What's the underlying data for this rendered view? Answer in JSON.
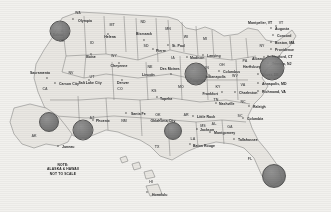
{
  "map": {
    "title": "United States state capitals map with highlighted metro markers",
    "note_lines": [
      "NOTE:",
      "ALASKA & HAWAII",
      "NOT TO SCALE"
    ],
    "colors": {
      "land": "#e9e7e2",
      "border": "#6f6f6f",
      "water": "#f2f1ee",
      "marker": "#747474",
      "text": "#1b1b1b"
    },
    "state_abbrs": [
      {
        "text": "WA",
        "x": 78,
        "y": 14
      },
      {
        "text": "OR",
        "x": 62,
        "y": 42
      },
      {
        "text": "CA",
        "x": 45,
        "y": 90
      },
      {
        "text": "ID",
        "x": 92,
        "y": 44
      },
      {
        "text": "NV",
        "x": 71,
        "y": 74
      },
      {
        "text": "UT",
        "x": 92,
        "y": 78
      },
      {
        "text": "AZ",
        "x": 92,
        "y": 119
      },
      {
        "text": "MT",
        "x": 112,
        "y": 26
      },
      {
        "text": "WY",
        "x": 114,
        "y": 57
      },
      {
        "text": "CO",
        "x": 120,
        "y": 90
      },
      {
        "text": "NM",
        "x": 124,
        "y": 122
      },
      {
        "text": "ND",
        "x": 143,
        "y": 23
      },
      {
        "text": "SD",
        "x": 146,
        "y": 47
      },
      {
        "text": "NE",
        "x": 150,
        "y": 68
      },
      {
        "text": "KS",
        "x": 154,
        "y": 92
      },
      {
        "text": "OK",
        "x": 158,
        "y": 116
      },
      {
        "text": "TX",
        "x": 157,
        "y": 148
      },
      {
        "text": "MN",
        "x": 168,
        "y": 30
      },
      {
        "text": "IA",
        "x": 173,
        "y": 59
      },
      {
        "text": "MO",
        "x": 181,
        "y": 88
      },
      {
        "text": "AR",
        "x": 186,
        "y": 116
      },
      {
        "text": "LA",
        "x": 193,
        "y": 140
      },
      {
        "text": "WI",
        "x": 186,
        "y": 38
      },
      {
        "text": "IL",
        "x": 193,
        "y": 70
      },
      {
        "text": "MI",
        "x": 205,
        "y": 40
      },
      {
        "text": "IN",
        "x": 207,
        "y": 69
      },
      {
        "text": "OH",
        "x": 222,
        "y": 66
      },
      {
        "text": "KY",
        "x": 218,
        "y": 88
      },
      {
        "text": "TN",
        "x": 216,
        "y": 101
      },
      {
        "text": "MS",
        "x": 203,
        "y": 127
      },
      {
        "text": "AL",
        "x": 214,
        "y": 125
      },
      {
        "text": "GA",
        "x": 230,
        "y": 128
      },
      {
        "text": "FL",
        "x": 250,
        "y": 160
      },
      {
        "text": "SC",
        "x": 240,
        "y": 117
      },
      {
        "text": "NC",
        "x": 243,
        "y": 103
      },
      {
        "text": "VA",
        "x": 243,
        "y": 86
      },
      {
        "text": "WV",
        "x": 235,
        "y": 77
      },
      {
        "text": "PA",
        "x": 245,
        "y": 62
      },
      {
        "text": "NY",
        "x": 262,
        "y": 47
      },
      {
        "text": "VT",
        "x": 281,
        "y": 24
      },
      {
        "text": "AK",
        "x": 34,
        "y": 137
      },
      {
        "text": "HI",
        "x": 151,
        "y": 183
      }
    ],
    "capitals": [
      {
        "name": "Salem",
        "x": 58,
        "y": 36,
        "sx": 62,
        "sy": 31,
        "align": "center"
      },
      {
        "name": "Olympia",
        "x": 78,
        "y": 22,
        "sx": 73,
        "sy": 19,
        "align": "left"
      },
      {
        "name": "Boise",
        "x": 91,
        "y": 58,
        "sx": 91,
        "sy": 54,
        "align": "center"
      },
      {
        "name": "Helena",
        "x": 110,
        "y": 38,
        "sx": 108,
        "sy": 34,
        "align": "center"
      },
      {
        "name": "Sacramento",
        "x": 30,
        "y": 74,
        "sx": 47,
        "sy": 78,
        "align": "left"
      },
      {
        "name": "Carson City",
        "x": 59,
        "y": 85,
        "sx": 55,
        "sy": 83,
        "align": "left"
      },
      {
        "name": "Salt Lake City",
        "x": 90,
        "y": 84,
        "sx": 89,
        "sy": 80,
        "align": "center"
      },
      {
        "name": "Cheyenne",
        "x": 119,
        "y": 67,
        "sx": 119,
        "sy": 63,
        "align": "center"
      },
      {
        "name": "Denver",
        "x": 123,
        "y": 84,
        "sx": 122,
        "sy": 80,
        "align": "center"
      },
      {
        "name": "Santa Fe",
        "x": 131,
        "y": 115,
        "sx": 126,
        "sy": 113,
        "align": "left"
      },
      {
        "name": "Bismarck",
        "x": 144,
        "y": 35,
        "sx": 144,
        "sy": 40,
        "align": "center"
      },
      {
        "name": "Pierre",
        "x": 156,
        "y": 52,
        "sx": 153,
        "sy": 49,
        "align": "left"
      },
      {
        "name": "St. Paul",
        "x": 172,
        "y": 47,
        "sx": 168,
        "sy": 45,
        "align": "left"
      },
      {
        "name": "Des Moines",
        "x": 170,
        "y": 70,
        "sx": 171,
        "sy": 74,
        "align": "center"
      },
      {
        "name": "Lincoln",
        "x": 142,
        "y": 76,
        "sx": 152,
        "sy": 75,
        "align": "left"
      },
      {
        "name": "Topeka",
        "x": 160,
        "y": 100,
        "sx": 157,
        "sy": 97,
        "align": "left"
      },
      {
        "name": "Oklahoma City",
        "x": 163,
        "y": 122,
        "sx": 161,
        "sy": 119,
        "align": "center"
      },
      {
        "name": "Little Rock",
        "x": 197,
        "y": 118,
        "sx": 193,
        "sy": 116,
        "align": "left"
      },
      {
        "name": "Jackson",
        "x": 200,
        "y": 131,
        "sx": 197,
        "sy": 129,
        "align": "left"
      },
      {
        "name": "Montgomery",
        "x": 214,
        "y": 134,
        "sx": 210,
        "sy": 132,
        "align": "left"
      },
      {
        "name": "Baton Rouge",
        "x": 193,
        "y": 147,
        "sx": 190,
        "sy": 144,
        "align": "left"
      },
      {
        "name": "Tallahassee",
        "x": 238,
        "y": 141,
        "sx": 234,
        "sy": 139,
        "align": "left"
      },
      {
        "name": "Madison",
        "x": 190,
        "y": 59,
        "sx": 187,
        "sy": 57,
        "align": "left"
      },
      {
        "name": "Springfield",
        "x": 187,
        "y": 82,
        "sx": 191,
        "sy": 79,
        "align": "left"
      },
      {
        "name": "Lansing",
        "x": 207,
        "y": 57,
        "sx": 203,
        "sy": 55,
        "align": "left"
      },
      {
        "name": "Indianapolis",
        "x": 205,
        "y": 78,
        "sx": 209,
        "sy": 75,
        "align": "left"
      },
      {
        "name": "Columbus",
        "x": 223,
        "y": 73,
        "sx": 219,
        "sy": 71,
        "align": "left"
      },
      {
        "name": "Frankfort",
        "x": 218,
        "y": 95,
        "sx": 222,
        "sy": 92,
        "align": "right"
      },
      {
        "name": "Nashville",
        "x": 219,
        "y": 105,
        "sx": 216,
        "sy": 103,
        "align": "left"
      },
      {
        "name": "Charleston",
        "x": 239,
        "y": 94,
        "sx": 235,
        "sy": 92,
        "align": "left"
      },
      {
        "name": "Raleigh",
        "x": 253,
        "y": 108,
        "sx": 249,
        "sy": 106,
        "align": "left"
      },
      {
        "name": "Columbia",
        "x": 247,
        "y": 120,
        "sx": 243,
        "sy": 118,
        "align": "left"
      },
      {
        "name": "Richmond, VA",
        "x": 262,
        "y": 93,
        "sx": 258,
        "sy": 91,
        "align": "left"
      },
      {
        "name": "Annapolis, MD",
        "x": 262,
        "y": 85,
        "sx": 258,
        "sy": 83,
        "align": "left"
      },
      {
        "name": "Dover, DE",
        "x": 262,
        "y": 76,
        "sx": 258,
        "sy": 74,
        "align": "left"
      },
      {
        "name": "Trenton, NJ",
        "x": 272,
        "y": 65,
        "sx": 268,
        "sy": 63,
        "align": "left"
      },
      {
        "name": "Hartford, CT",
        "x": 272,
        "y": 58,
        "sx": 268,
        "sy": 56,
        "align": "left"
      },
      {
        "name": "Providence",
        "x": 275,
        "y": 51,
        "sx": 271,
        "sy": 49,
        "align": "left"
      },
      {
        "name": "Boston, MA",
        "x": 275,
        "y": 44,
        "sx": 271,
        "sy": 42,
        "align": "left"
      },
      {
        "name": "Concord",
        "x": 277,
        "y": 37,
        "sx": 273,
        "sy": 35,
        "align": "left"
      },
      {
        "name": "Augusta",
        "x": 275,
        "y": 30,
        "sx": 271,
        "sy": 28,
        "align": "left"
      },
      {
        "name": "Montpelier, VT",
        "x": 248,
        "y": 24,
        "sx": 276,
        "sy": 26,
        "align": "left"
      },
      {
        "name": "Albany",
        "x": 252,
        "y": 60,
        "sx": 264,
        "sy": 57,
        "align": "left"
      },
      {
        "name": "Harrisburg",
        "x": 243,
        "y": 68,
        "sx": 250,
        "sy": 66,
        "align": "left"
      },
      {
        "name": "Phoenix",
        "x": 96,
        "y": 122,
        "sx": 93,
        "sy": 120,
        "align": "left"
      },
      {
        "name": "Honolulu",
        "x": 152,
        "y": 196,
        "sx": 147,
        "sy": 192,
        "align": "left"
      },
      {
        "name": "Juneau",
        "x": 62,
        "y": 148,
        "sx": 58,
        "sy": 146,
        "align": "left"
      }
    ],
    "markers": [
      {
        "label": "Portland metro",
        "x": 60,
        "y": 31,
        "r": 9.5
      },
      {
        "label": "Los Angeles metro",
        "x": 49,
        "y": 122,
        "r": 9.0
      },
      {
        "label": "Phoenix metro",
        "x": 83,
        "y": 130,
        "r": 9.5
      },
      {
        "label": "Dallas metro",
        "x": 173,
        "y": 131,
        "r": 8.0
      },
      {
        "label": "Chicago metro",
        "x": 196,
        "y": 74,
        "r": 10.5
      },
      {
        "label": "New York metro",
        "x": 272,
        "y": 68,
        "r": 11.5
      },
      {
        "label": "Miami metro",
        "x": 274,
        "y": 176,
        "r": 11.0
      }
    ]
  }
}
